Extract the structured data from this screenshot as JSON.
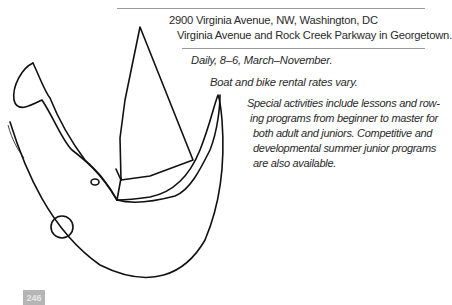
{
  "address": {
    "line1": "2900 Virginia Avenue, NW, Washington, DC",
    "line2": "Virginia Avenue and Rock Creek Parkway in Georgetown."
  },
  "hours": "Daily, 8–6, March–November.",
  "rates": "Boat and bike rental rates vary.",
  "activities": {
    "lines": [
      "Special activities include lessons and row-",
      "ing programs from beginner to master for",
      "both adult and juniors. Competitive and",
      "developmental summer junior programs",
      "are also available."
    ]
  },
  "page_number": "246",
  "drawing": {
    "description": "hand-drawn sailboat sketch",
    "stroke_color": "#111111"
  },
  "colors": {
    "rule": "#9a9a9a",
    "text": "#2a2a2a",
    "page_badge": "#b5b5b5"
  }
}
